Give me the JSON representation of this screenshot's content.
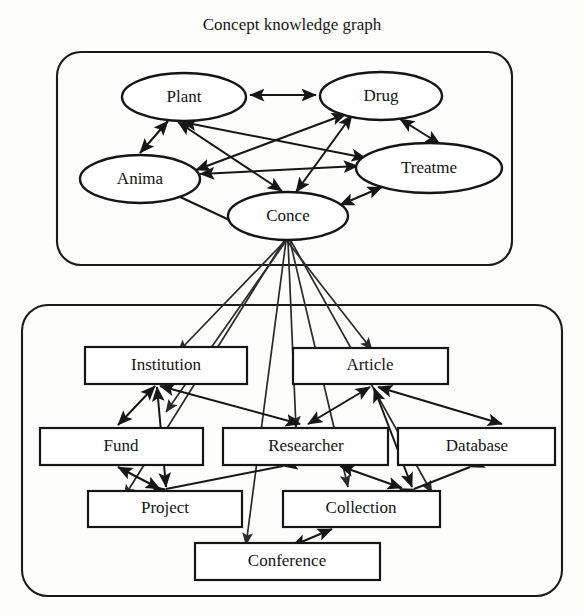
{
  "title": "Concept knowledge graph",
  "groups": [
    {
      "id": "concept-layer",
      "name": "concept-layer-box"
    },
    {
      "id": "entity-layer",
      "name": "entity-layer-box"
    }
  ],
  "concept_nodes": [
    {
      "id": "plant",
      "label": "Plant",
      "cx": 184,
      "cy": 97,
      "rx": 62,
      "ry": 24
    },
    {
      "id": "drug",
      "label": "Drug",
      "cx": 381,
      "cy": 96,
      "rx": 61,
      "ry": 24
    },
    {
      "id": "anima",
      "label": "Anima",
      "cx": 140,
      "cy": 179,
      "rx": 60,
      "ry": 24
    },
    {
      "id": "treatme",
      "label": "Treatme",
      "cx": 429,
      "cy": 168,
      "rx": 73,
      "ry": 25
    },
    {
      "id": "conce",
      "label": "Conce",
      "cx": 288,
      "cy": 216,
      "rx": 60,
      "ry": 24
    }
  ],
  "entity_nodes": [
    {
      "id": "institution",
      "label": "Institution",
      "x": 85,
      "y": 347,
      "w": 162,
      "h": 37
    },
    {
      "id": "article",
      "label": "Article",
      "x": 293,
      "y": 348,
      "w": 155,
      "h": 36
    },
    {
      "id": "fund",
      "label": "Fund",
      "x": 40,
      "y": 428,
      "w": 163,
      "h": 37
    },
    {
      "id": "researcher",
      "label": "Researcher",
      "x": 223,
      "y": 428,
      "w": 165,
      "h": 37
    },
    {
      "id": "database",
      "label": "Database",
      "x": 398,
      "y": 428,
      "w": 157,
      "h": 37
    },
    {
      "id": "project",
      "label": "Project",
      "x": 88,
      "y": 491,
      "w": 154,
      "h": 36
    },
    {
      "id": "collection",
      "label": "Collection",
      "x": 283,
      "y": 491,
      "w": 157,
      "h": 36
    },
    {
      "id": "conference",
      "label": "Conference",
      "x": 195,
      "y": 543,
      "w": 185,
      "h": 37
    }
  ],
  "concept_edges": [
    {
      "from": "plant",
      "to": "drug",
      "dir": "both"
    },
    {
      "from": "plant",
      "to": "anima",
      "dir": "both"
    },
    {
      "from": "plant",
      "to": "treatme",
      "dir": "both"
    },
    {
      "from": "plant",
      "to": "conce",
      "dir": "both"
    },
    {
      "from": "drug",
      "to": "anima",
      "dir": "both"
    },
    {
      "from": "drug",
      "to": "conce",
      "dir": "both"
    },
    {
      "from": "drug",
      "to": "treatme",
      "dir": "both"
    },
    {
      "from": "anima",
      "to": "treatme",
      "dir": "both"
    },
    {
      "from": "anima",
      "to": "conce",
      "dir": "both"
    },
    {
      "from": "conce",
      "to": "treatme",
      "dir": "both"
    }
  ],
  "fan_edges": [
    {
      "from": "conce",
      "to": "institution",
      "dir": "to"
    },
    {
      "from": "conce",
      "to": "article",
      "dir": "to"
    },
    {
      "from": "conce",
      "to": "fund",
      "dir": "to"
    },
    {
      "from": "conce",
      "to": "researcher",
      "dir": "to"
    },
    {
      "from": "conce",
      "to": "database",
      "dir": "to"
    },
    {
      "from": "conce",
      "to": "project",
      "dir": "to"
    },
    {
      "from": "conce",
      "to": "collection",
      "dir": "to"
    },
    {
      "from": "conce",
      "to": "conference",
      "dir": "to"
    }
  ],
  "entity_edges": [
    {
      "from": "institution",
      "to": "fund",
      "dir": "both"
    },
    {
      "from": "institution",
      "to": "researcher",
      "dir": "both"
    },
    {
      "from": "institution",
      "to": "project",
      "dir": "both"
    },
    {
      "from": "article",
      "to": "researcher",
      "dir": "both"
    },
    {
      "from": "article",
      "to": "database",
      "dir": "both"
    },
    {
      "from": "article",
      "to": "collection",
      "dir": "both"
    },
    {
      "from": "fund",
      "to": "project",
      "dir": "both"
    },
    {
      "from": "researcher",
      "to": "project",
      "dir": "both"
    },
    {
      "from": "researcher",
      "to": "collection",
      "dir": "both"
    },
    {
      "from": "database",
      "to": "collection",
      "dir": "both"
    },
    {
      "from": "collection",
      "to": "conference",
      "dir": "both"
    }
  ],
  "colors": {
    "stroke": "#151515",
    "node_fill": "#ffffff",
    "background": "#fdfdfc"
  }
}
